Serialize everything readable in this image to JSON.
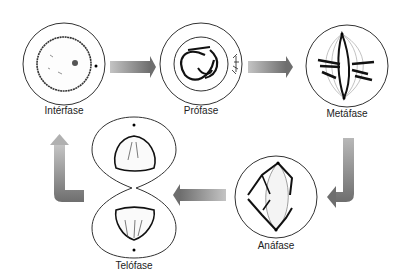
{
  "diagram": {
    "type": "cell-cycle-mitosis",
    "phases": [
      {
        "id": "interfase",
        "label": "Intérfase"
      },
      {
        "id": "profase",
        "label": "Prófase"
      },
      {
        "id": "metafase",
        "label": "Metáfase"
      },
      {
        "id": "anafase",
        "label": "Anáfase"
      },
      {
        "id": "telofase",
        "label": "Telófase"
      }
    ],
    "arrows": [
      {
        "from": "interfase",
        "to": "profase",
        "direction": "right"
      },
      {
        "from": "profase",
        "to": "metafase",
        "direction": "right"
      },
      {
        "from": "metafase",
        "to": "anafase",
        "direction": "down-left"
      },
      {
        "from": "anafase",
        "to": "telofase",
        "direction": "left"
      },
      {
        "from": "telofase",
        "to": "interfase",
        "direction": "left-up"
      }
    ],
    "colors": {
      "arrow_dark": "#6e6e6e",
      "arrow_light": "#c4c4c4",
      "outline": "#333333"
    }
  }
}
